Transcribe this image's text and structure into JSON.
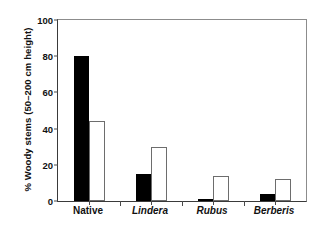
{
  "chart_data": {
    "type": "bar",
    "title": "",
    "xlabel": "",
    "ylabel": "% Woody stems (50–200 cm height)",
    "categories": [
      "Native",
      "Lindera",
      "Rubus",
      "Berberis"
    ],
    "category_styles": [
      "regular",
      "italic",
      "italic",
      "italic"
    ],
    "series": [
      {
        "name": "filled",
        "values": [
          80,
          15,
          1,
          4
        ]
      },
      {
        "name": "open",
        "values": [
          44,
          30,
          14,
          12
        ]
      }
    ],
    "ylim": [
      0,
      100
    ],
    "yticks": [
      0,
      20,
      40,
      60,
      80,
      100
    ],
    "ytick_labels": [
      "0",
      "20",
      "40",
      "60",
      "80",
      "100"
    ],
    "grid": false,
    "legend": "none",
    "colors": {
      "filled_bar": "#000000",
      "open_bar_fill": "#ffffff",
      "open_bar_stroke": "#6d6d6d",
      "axis": "#3a3a3a",
      "frame": "#8c8c8c",
      "text": "#111111",
      "background": "#ffffff"
    }
  }
}
